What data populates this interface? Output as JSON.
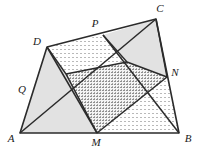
{
  "figure": {
    "canvas": {
      "width": 199,
      "height": 148
    },
    "background_color": "#ffffff",
    "stroke_color": "#2b2b2b",
    "fill_solid_gray": "#e2e2e2",
    "fill_dotted_light": "#f2f2f2",
    "fill_dotted_dense": "#dcdcdc"
  },
  "points": {
    "A": {
      "label": "A",
      "x": 20,
      "y": 133,
      "label_x": 10,
      "label_y": 140
    },
    "B": {
      "label": "B",
      "x": 179,
      "y": 133,
      "label_x": 184,
      "label_y": 140
    },
    "C": {
      "label": "C",
      "x": 156,
      "y": 19,
      "label_x": 158,
      "label_y": 11
    },
    "D": {
      "label": "D",
      "x": 47,
      "y": 47,
      "label_x": 37,
      "label_y": 43
    },
    "M": {
      "label": "M",
      "x": 97,
      "y": 133,
      "label_x": 93,
      "label_y": 145
    },
    "N": {
      "label": "N",
      "x": 167,
      "y": 77,
      "label_x": 171,
      "label_y": 74
    },
    "P": {
      "label": "P",
      "x": 103,
      "y": 35,
      "label_x": 94,
      "label_y": 25
    },
    "Q": {
      "label": "Q",
      "x": 33,
      "y": 89,
      "label_x": 21,
      "label_y": 91
    }
  },
  "polygons": {
    "outer_quad": {
      "name": "ABCD",
      "vertices": "A,B,C,D",
      "fill": "none"
    },
    "inner_quad": {
      "name": "MNPQ",
      "vertices": "M,N,P,Q",
      "fill": "dotted-dense"
    },
    "region_dpc": {
      "name": "DPC-band",
      "fill": "dotted-light"
    },
    "region_pcn": {
      "name": "PCN",
      "fill": "solid-gray"
    },
    "region_aqd": {
      "name": "AQD",
      "fill": "solid-gray"
    },
    "region_mbn": {
      "name": "MBN",
      "fill": "dotted-light"
    }
  },
  "segments": [
    {
      "name": "side-AB",
      "from": "A",
      "to": "B"
    },
    {
      "name": "side-BC",
      "from": "B",
      "to": "C"
    },
    {
      "name": "side-CD",
      "from": "C",
      "to": "D"
    },
    {
      "name": "side-DA",
      "from": "D",
      "to": "A"
    },
    {
      "name": "mid-MN",
      "from": "M",
      "to": "N"
    },
    {
      "name": "mid-NP",
      "from": "N",
      "to": "P"
    },
    {
      "name": "mid-PQ",
      "from": "P",
      "to": "Q"
    },
    {
      "name": "mid-QM",
      "from": "Q",
      "to": "M"
    },
    {
      "name": "diagonal-AC",
      "from": "A",
      "to": "C"
    },
    {
      "name": "chord-DM",
      "from": "D",
      "to": "M"
    },
    {
      "name": "chord-PB",
      "from": "P",
      "to": "B"
    }
  ],
  "labels_order": [
    "D",
    "P",
    "C",
    "Q",
    "N",
    "A",
    "M",
    "B"
  ]
}
